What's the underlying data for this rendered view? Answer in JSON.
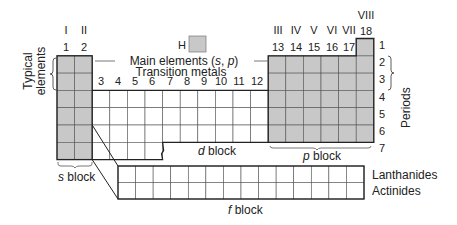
{
  "diagram": {
    "colors": {
      "main_fill": "#c8c8c8",
      "grid_line": "#555555",
      "outline": "#222222",
      "text": "#222222"
    },
    "roman_groups": [
      {
        "group": 1,
        "roman": "I"
      },
      {
        "group": 2,
        "roman": "II"
      },
      {
        "group": 13,
        "roman": "III"
      },
      {
        "group": 14,
        "roman": "IV"
      },
      {
        "group": 15,
        "roman": "V"
      },
      {
        "group": 16,
        "roman": "VI"
      },
      {
        "group": 17,
        "roman": "VII"
      },
      {
        "group": 18,
        "roman": "VIII"
      }
    ],
    "group_numbers": [
      "1",
      "2",
      "3",
      "4",
      "5",
      "6",
      "7",
      "8",
      "9",
      "10",
      "11",
      "12",
      "13",
      "14",
      "15",
      "16",
      "17",
      "18"
    ],
    "period_numbers": [
      "1",
      "2",
      "3",
      "4",
      "5",
      "6",
      "7"
    ],
    "hydrogen_label": "H",
    "main_elements_label": "Main elements (",
    "main_elements_s": "s",
    "main_elements_sep": ", ",
    "main_elements_p": "p",
    "main_elements_close": ")",
    "transition_metals_label": "Transition metals",
    "typical_elements_line1": "Typical",
    "typical_elements_line2": "elements",
    "periods_label": "Periods",
    "s_block_italic": "s",
    "s_block_label": " block",
    "d_block_italic": "d",
    "d_block_label": " block",
    "p_block_italic": "p",
    "p_block_label": " block",
    "f_block_italic": "f",
    "f_block_label": " block",
    "lanthanides_label": "Lanthanides",
    "actinides_label": "Actinides",
    "f_block_columns": 14,
    "f_block_rows": 2
  }
}
